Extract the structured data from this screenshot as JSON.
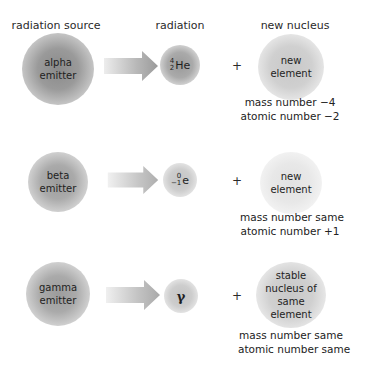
{
  "headers": {
    "source": "radiation source",
    "radiation": "radiation",
    "nucleus": "new nucleus"
  },
  "rows": [
    {
      "source": {
        "line1": "alpha",
        "line2": "emitter"
      },
      "radiation": {
        "mass": "4",
        "atomic": "2",
        "symbol": "He"
      },
      "plus": "+",
      "nucleus": {
        "line1": "new",
        "line2": "element",
        "line3": ""
      },
      "note": {
        "line1": "mass number −4",
        "line2": "atomic number −2"
      }
    },
    {
      "source": {
        "line1": "beta",
        "line2": "emitter"
      },
      "radiation": {
        "mass": "0",
        "atomic": "−1",
        "symbol": "e"
      },
      "plus": "+",
      "nucleus": {
        "line1": "new",
        "line2": "element",
        "line3": ""
      },
      "note": {
        "line1": "mass number same",
        "line2": "atomic number +1"
      }
    },
    {
      "source": {
        "line1": "gamma",
        "line2": "emitter"
      },
      "radiation": {
        "symbol": "γ"
      },
      "plus": "+",
      "nucleus": {
        "line1": "stable",
        "line2": "nucleus of",
        "line3": "same element"
      },
      "note": {
        "line1": "mass number same",
        "line2": "atomic number same"
      }
    }
  ]
}
